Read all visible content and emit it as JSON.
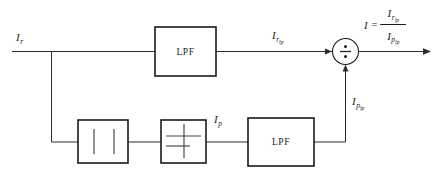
{
  "figure": {
    "background_color": "#ffffff",
    "line_color": "#2b2b2b",
    "block_border_color": "#1a1a1a"
  },
  "signals": {
    "input": {
      "var": "I",
      "sub": "r",
      "subsub": ""
    },
    "filtered_reference": {
      "var": "I",
      "sub": "r",
      "subsub": "lp"
    },
    "peak": {
      "var": "I",
      "sub": "p",
      "subsub": ""
    },
    "filtered_peak": {
      "var": "I",
      "sub": "p",
      "subsub": "lp"
    },
    "output": {
      "var": "I",
      "sub": "",
      "subsub": ""
    }
  },
  "blocks": [
    {
      "id": "lpf-top",
      "label": "LPF",
      "name": "low-pass-filter-top"
    },
    {
      "id": "abs",
      "label": "",
      "name": "absolute-value-block"
    },
    {
      "id": "peak-detect",
      "label": "",
      "name": "peak-detector-block"
    },
    {
      "id": "lpf-bottom",
      "label": "LPF",
      "name": "low-pass-filter-bottom"
    }
  ],
  "nodes": [
    {
      "id": "divider",
      "symbol": "division",
      "name": "division-node"
    }
  ],
  "equation": {
    "lhs": "I",
    "operator": "=",
    "numerator": {
      "var": "I",
      "sub": "r",
      "subsub": "lp"
    },
    "denominator": {
      "var": "I",
      "sub": "p",
      "subsub": "lp"
    }
  }
}
